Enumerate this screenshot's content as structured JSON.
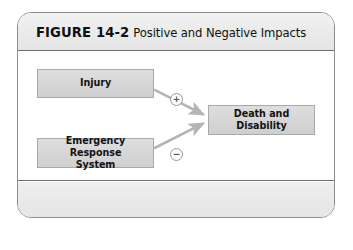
{
  "figure": {
    "label": "FIGURE 14-2",
    "caption": "Positive and Negative Impacts"
  },
  "diagram": {
    "type": "causal-loop-diagram",
    "nodes": [
      {
        "id": "injury",
        "label": "Injury"
      },
      {
        "id": "ems",
        "label": "Emergency Response\nSystem"
      },
      {
        "id": "outcome",
        "label": "Death and\nDisability"
      }
    ],
    "edges": [
      {
        "from": "injury",
        "to": "outcome",
        "sign": "+",
        "polarity": "positive"
      },
      {
        "from": "ems",
        "to": "outcome",
        "sign": "−",
        "polarity": "negative"
      }
    ],
    "node_labels": {
      "injury": "Injury",
      "ems_line1": "Emergency Response",
      "ems_line2": "System",
      "outcome_line1": "Death and",
      "outcome_line2": "Disability"
    },
    "signs": {
      "positive": "+",
      "negative": "−"
    }
  },
  "colors": {
    "card_border": "#8d8d8d",
    "header_band": "#eaeaea",
    "footer_band": "#e9e9e9",
    "node_fill": "#d6d6d6",
    "node_border": "#a9a9a9",
    "arrow": "#b4b4b4",
    "text": "#131313"
  }
}
